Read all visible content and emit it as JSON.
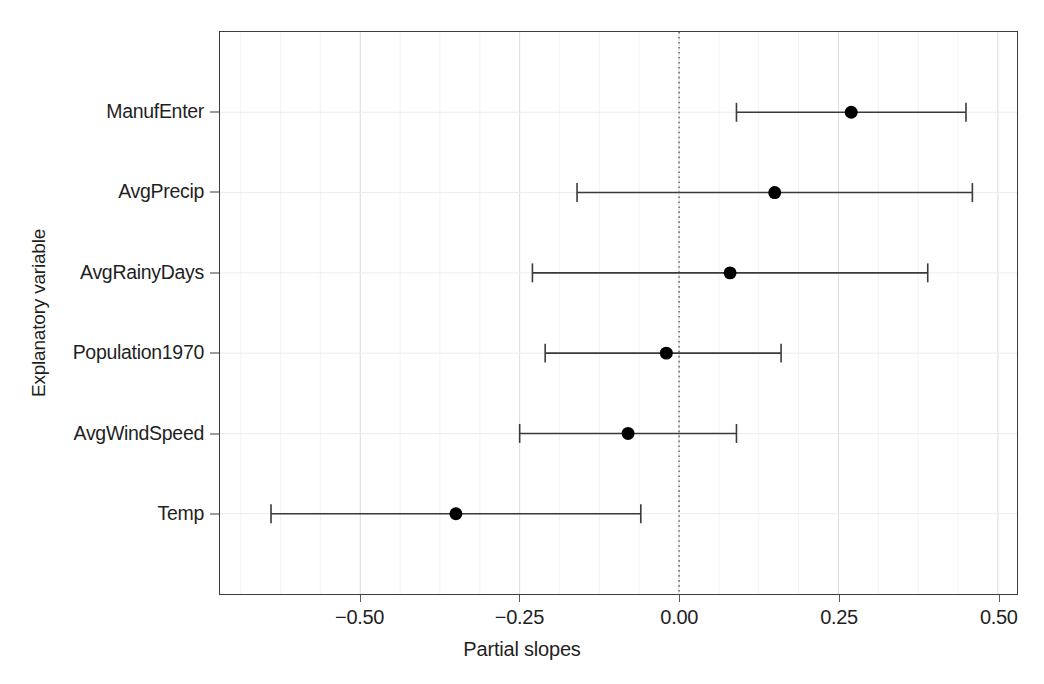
{
  "chart_data": {
    "type": "scatter",
    "subtype": "coefficient-plot-with-confidence-intervals",
    "title": "",
    "xlabel": "Partial slopes",
    "ylabel": "Explanatory variable",
    "xlim": [
      -0.72,
      0.53
    ],
    "xticks": [
      -0.5,
      -0.25,
      0.0,
      0.25,
      0.5
    ],
    "xticklabels": [
      "−0.50",
      "−0.25",
      "0.00",
      "0.25",
      "0.50"
    ],
    "grid": true,
    "grid_color": "#e8e8e8",
    "reference_line": {
      "value": 0.0,
      "style": "dotted",
      "color": "#555555"
    },
    "marker": {
      "shape": "circle",
      "color": "#000000",
      "size": 13
    },
    "errorbar": {
      "color": "#3a3a3a",
      "capstyle": "tee"
    },
    "categories": [
      "ManufEnter",
      "AvgPrecip",
      "AvgRainyDays",
      "Population1970",
      "AvgWindSpeed",
      "Temp"
    ],
    "points": [
      {
        "label": "ManufEnter",
        "estimate": 0.27,
        "lower": 0.09,
        "upper": 0.45
      },
      {
        "label": "AvgPrecip",
        "estimate": 0.15,
        "lower": -0.16,
        "upper": 0.46
      },
      {
        "label": "AvgRainyDays",
        "estimate": 0.08,
        "lower": -0.23,
        "upper": 0.39
      },
      {
        "label": "Population1970",
        "estimate": -0.02,
        "lower": -0.21,
        "upper": 0.16
      },
      {
        "label": "AvgWindSpeed",
        "estimate": -0.08,
        "lower": -0.25,
        "upper": 0.09
      },
      {
        "label": "Temp",
        "estimate": -0.35,
        "lower": -0.64,
        "upper": -0.06
      }
    ]
  },
  "axes": {
    "x_title": "Partial slopes",
    "y_title": "Explanatory variable"
  }
}
